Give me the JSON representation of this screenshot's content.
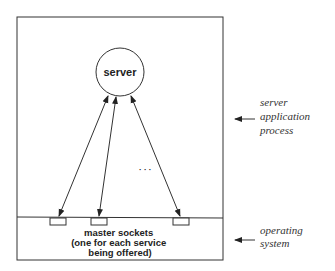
{
  "diagram": {
    "server_label": "server",
    "ellipsis": "· · ·",
    "sockets_label": [
      "master sockets",
      "(one for each service",
      "being offered)"
    ],
    "side_labels": {
      "application": [
        "server",
        "application",
        "process"
      ],
      "os": [
        "operating",
        "system"
      ]
    },
    "nodes": [
      "server",
      "master socket 1",
      "master socket 2",
      "master socket 3"
    ],
    "edges": [
      {
        "from": "server",
        "to": "master socket 1",
        "bidirectional": true
      },
      {
        "from": "server",
        "to": "master socket 2",
        "bidirectional": true
      },
      {
        "from": "server",
        "to": "master socket 3",
        "bidirectional": true
      }
    ],
    "colors": {
      "stroke": "#333333",
      "background": "#ffffff"
    }
  }
}
